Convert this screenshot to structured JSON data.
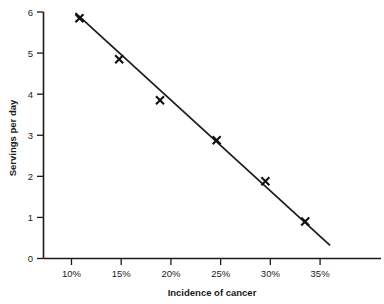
{
  "chart_data": {
    "type": "scatter",
    "title": "",
    "subtitle": "",
    "xlabel": "Incidence of cancer",
    "ylabel": "Servings per day",
    "xlim": [
      7.1875,
      41.125
    ],
    "ylim": [
      0,
      6.0
    ],
    "grid": false,
    "legend": null,
    "x_tick_labels": [
      "10%",
      "15%",
      "20%",
      "25%",
      "30%",
      "35%"
    ],
    "x_tick_values": [
      10,
      15,
      20,
      25,
      30,
      35
    ],
    "y_tick_labels": [
      "0",
      "1",
      "2",
      "3",
      "4",
      "5",
      "6"
    ],
    "y_tick_values": [
      0,
      1,
      2,
      3,
      4,
      5,
      6
    ],
    "series": [
      {
        "name": "Observations",
        "marker": "x",
        "x": [
          10.8,
          14.8,
          18.9,
          24.6,
          29.5,
          33.5
        ],
        "y": [
          5.85,
          4.85,
          3.85,
          2.88,
          1.88,
          0.9
        ]
      },
      {
        "name": "Trend line",
        "type": "line",
        "x": [
          10.4,
          36.0
        ],
        "y": [
          5.98,
          0.32
        ]
      }
    ],
    "annotations": []
  },
  "axes": {
    "x_axis_label": "Incidence of cancer",
    "y_axis_label": "Servings per day"
  },
  "colors": {
    "ink": "#1a1a1a",
    "marker": "#111111",
    "background": "#ffffff"
  }
}
